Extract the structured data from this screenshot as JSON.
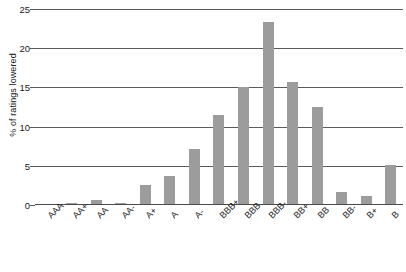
{
  "chart_data": {
    "type": "bar",
    "title": "",
    "xlabel": "",
    "ylabel": "% of ratings lowered",
    "ylim": [
      0,
      25
    ],
    "yticks": [
      0,
      5,
      10,
      15,
      20,
      25
    ],
    "ytick_labels": [
      "0",
      "5",
      "10",
      "15",
      "20",
      "25"
    ],
    "grid": true,
    "legend": "none",
    "bar_color": "#9c9c9c",
    "categories": [
      "AAA",
      "AA+",
      "AA",
      "AA-",
      "A+",
      "A",
      "A-",
      "BBB+",
      "BBB",
      "BBB-",
      "BB+",
      "BB",
      "BB-",
      "B+",
      "B"
    ],
    "values": [
      0.1,
      0.2,
      0.7,
      0.2,
      2.6,
      3.7,
      7.1,
      11.5,
      15.1,
      23.3,
      15.7,
      12.5,
      1.6,
      1.2,
      5.1
    ]
  }
}
